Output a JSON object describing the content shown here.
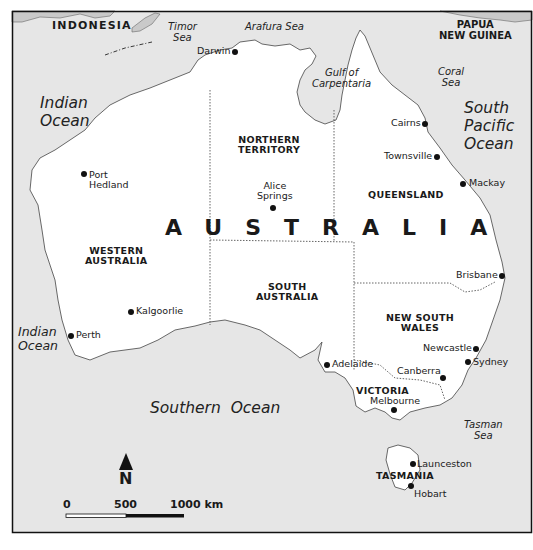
{
  "map": {
    "title": "AUSTRALIA",
    "colors": {
      "land": "#ffffff",
      "sea": "#e6e6e6",
      "neighbour_land": "#c9c9c9",
      "frame": "#111111",
      "text": "#1a1a1a"
    },
    "countries": [
      {
        "name": "INDONESIA"
      },
      {
        "name": "PAPUA\nNEW GUINEA",
        "line1": "PAPUA",
        "line2": "NEW GUINEA"
      }
    ],
    "seas": {
      "timor": {
        "line1": "Timor",
        "line2": "Sea"
      },
      "arafura": {
        "line1": "Arafura Sea"
      },
      "carpentaria": {
        "line1": "Gulf of",
        "line2": "Carpentaria"
      },
      "coral": {
        "line1": "Coral",
        "line2": "Sea"
      },
      "tasman": {
        "line1": "Tasman",
        "line2": "Sea"
      }
    },
    "oceans": {
      "indian_north": {
        "line1": "Indian",
        "line2": "Ocean"
      },
      "indian_south": {
        "line1": "Indian",
        "line2": "Ocean"
      },
      "south_pacific": {
        "line1": "South",
        "line2": "Pacific",
        "line3": "Ocean"
      },
      "southern": {
        "line1": "Southern  Ocean"
      }
    },
    "states": {
      "nt": {
        "line1": "NORTHERN",
        "line2": "TERRITORY"
      },
      "qld": {
        "line1": "QUEENSLAND"
      },
      "wa": {
        "line1": "WESTERN",
        "line2": "AUSTRALIA"
      },
      "sa": {
        "line1": "SOUTH",
        "line2": "AUSTRALIA"
      },
      "nsw": {
        "line1": "NEW SOUTH",
        "line2": "WALES"
      },
      "vic": {
        "line1": "VICTORIA"
      },
      "tas": {
        "line1": "TASMANIA"
      }
    },
    "cities": {
      "darwin": "Darwin",
      "cairns": "Cairns",
      "townsville": "Townsville",
      "mackay": "Mackay",
      "port_hedland_1": "Port",
      "port_hedland_2": "Hedland",
      "alice_1": "Alice",
      "alice_2": "Springs",
      "brisbane": "Brisbane",
      "kalgoorlie": "Kalgoorlie",
      "perth": "Perth",
      "adelaide": "Adelaide",
      "newcastle": "Newcastle",
      "sydney": "Sydney",
      "canberra": "Canberra",
      "melbourne": "Melbourne",
      "launceston": "Launceston",
      "hobart": "Hobart"
    },
    "north_arrow": {
      "label": "N",
      "icon": "north-arrow-icon"
    },
    "scale_bar": {
      "labels": [
        "0",
        "500",
        "1000 km"
      ],
      "unit": "km",
      "max": 1000
    }
  }
}
